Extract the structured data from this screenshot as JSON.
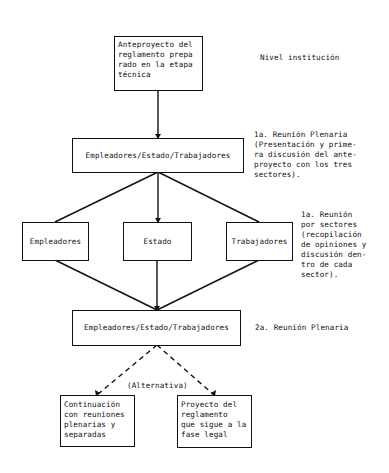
{
  "diagram": {
    "nodes": {
      "anteproyecto": "Anteproyecto del\nreglamento prepa\nrado en la etapa\ntécnica",
      "plenaria1": "Empleadores/Estado/Trabajadores",
      "empleadores": "Empleadores",
      "estado": "Estado",
      "trabajadores": "Trabajadores",
      "plenaria2": "Empleadores/Estado/Trabajadores",
      "continuacion": "Continuación\ncon reuniones\nplenarias y\nseparadas",
      "proyecto": "Proyecto del\nreglamento\nque sigue a la\nfase legal"
    },
    "annotations": {
      "nivel": "Nivel institución",
      "reunion1": "1a. Reunión Plenaria\n(Presentación y prime-\nra discusión del ante-\nproyecto con los tres\nsectores).",
      "sectores": "1a. Reunión\npor sectores\n(recopilación\nde opiniones y\ndiscusión den-\ntro de cada\nsector).",
      "reunion2": "2a. Reunión Plenaria",
      "alternativa": "(Alternativa)"
    },
    "edges": [
      {
        "from": "anteproyecto",
        "to": "plenaria1",
        "style": "solid"
      },
      {
        "from": "plenaria1",
        "to": "empleadores",
        "style": "solid"
      },
      {
        "from": "plenaria1",
        "to": "estado",
        "style": "solid"
      },
      {
        "from": "plenaria1",
        "to": "trabajadores",
        "style": "solid"
      },
      {
        "from": "empleadores",
        "to": "plenaria2",
        "style": "solid"
      },
      {
        "from": "estado",
        "to": "plenaria2",
        "style": "solid"
      },
      {
        "from": "trabajadores",
        "to": "plenaria2",
        "style": "solid"
      },
      {
        "from": "plenaria2",
        "to": "continuacion",
        "style": "dashed"
      },
      {
        "from": "plenaria2",
        "to": "proyecto",
        "style": "dashed"
      }
    ],
    "colors": {
      "ink": "#111111",
      "background": "#ffffff"
    }
  }
}
